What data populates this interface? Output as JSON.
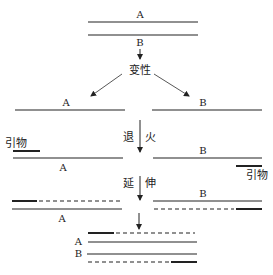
{
  "stages": {
    "denature": "变性",
    "anneal_left": "退",
    "anneal_right": "火",
    "extend_left": "延",
    "extend_right": "伸"
  },
  "strands": {
    "a": "A",
    "b": "B"
  },
  "primer_label": "引物",
  "colors": {
    "line": "#222222",
    "background": "#ffffff"
  }
}
